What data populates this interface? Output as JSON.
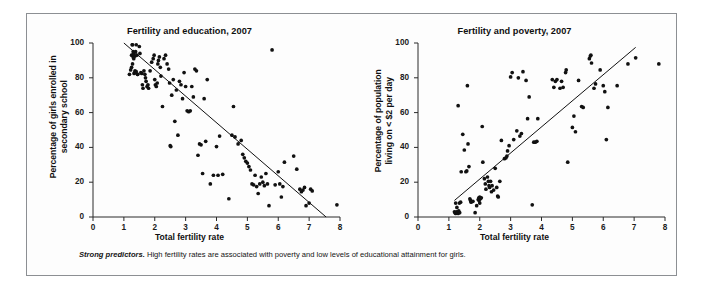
{
  "figure": {
    "caption_lead": "Strong predictors.",
    "caption_body": " High fertility rates are associated with poverty and low levels of educational attainment for girls."
  },
  "chart_data": [
    {
      "type": "scatter",
      "id": "fertility-education",
      "title": "Fertility and education, 2007",
      "xlabel": "Total fertility rate",
      "ylabel": "Percentage of girls enrolled in secondary school",
      "ylabel_lines": [
        "Percentage of girls enrolled in",
        "secondary school"
      ],
      "xlim": [
        0,
        8
      ],
      "ylim": [
        0,
        100
      ],
      "xticks": [
        0,
        1,
        2,
        3,
        4,
        5,
        6,
        7,
        8
      ],
      "yticks": [
        0,
        20,
        40,
        60,
        80,
        100
      ],
      "grid": false,
      "legend": "none",
      "marker_color": "#111111",
      "trendline": {
        "x0": 1.0,
        "y0": 100.0,
        "x1": 7.55,
        "y1": 0.0,
        "color": "#111111"
      },
      "x": [
        1.18,
        1.22,
        1.25,
        1.27,
        1.28,
        1.3,
        1.3,
        1.31,
        1.32,
        1.33,
        1.35,
        1.36,
        1.38,
        1.4,
        1.42,
        1.45,
        1.25,
        1.28,
        1.32,
        1.36,
        1.4,
        1.44,
        1.5,
        1.52,
        1.55,
        1.58,
        1.6,
        1.62,
        1.65,
        1.68,
        1.7,
        1.72,
        1.75,
        1.78,
        1.8,
        1.85,
        1.9,
        1.95,
        1.98,
        2.0,
        2.02,
        2.05,
        2.08,
        2.1,
        2.12,
        2.15,
        2.18,
        2.2,
        2.25,
        2.3,
        2.35,
        2.4,
        2.45,
        2.48,
        2.5,
        2.52,
        2.55,
        2.6,
        2.65,
        2.7,
        2.75,
        2.8,
        2.85,
        2.9,
        2.95,
        3.0,
        3.05,
        3.1,
        3.15,
        3.2,
        3.25,
        3.3,
        3.35,
        3.4,
        3.45,
        3.5,
        3.55,
        3.6,
        3.65,
        3.7,
        3.8,
        3.9,
        4.0,
        4.05,
        4.1,
        4.2,
        4.4,
        4.5,
        4.55,
        4.6,
        4.7,
        4.8,
        4.85,
        4.9,
        4.95,
        5.0,
        5.05,
        5.1,
        5.15,
        5.2,
        5.25,
        5.3,
        5.35,
        5.4,
        5.45,
        5.5,
        5.55,
        5.6,
        5.65,
        5.7,
        5.8,
        5.9,
        6.0,
        6.05,
        6.1,
        6.15,
        6.2,
        6.5,
        6.6,
        6.7,
        6.75,
        6.8,
        6.85,
        6.9,
        7.0,
        7.05,
        7.1,
        7.9
      ],
      "y": [
        82.0,
        84.5,
        93.0,
        99.0,
        99.0,
        92.0,
        95.0,
        93.5,
        94.0,
        82.5,
        83.0,
        92.5,
        95.0,
        99.0,
        93.0,
        82.0,
        86.0,
        88.0,
        91.0,
        84.0,
        83.5,
        82.0,
        98.0,
        94.0,
        83.0,
        82.5,
        76.0,
        74.0,
        84.0,
        82.0,
        80.0,
        78.0,
        75.0,
        76.0,
        74.0,
        84.0,
        89.0,
        91.0,
        93.0,
        79.0,
        76.0,
        75.0,
        77.0,
        88.0,
        90.0,
        92.0,
        86.0,
        81.0,
        63.5,
        91.0,
        93.0,
        88.0,
        85.0,
        77.0,
        41.0,
        40.5,
        70.0,
        79.0,
        55.0,
        73.0,
        47.0,
        78.0,
        76.0,
        68.0,
        83.0,
        75.0,
        61.0,
        60.5,
        61.0,
        75.0,
        69.0,
        85.0,
        84.0,
        35.5,
        42.0,
        41.5,
        25.0,
        68.0,
        43.5,
        79.0,
        19.0,
        24.0,
        40.5,
        24.0,
        46.5,
        24.5,
        10.5,
        47.0,
        63.5,
        46.0,
        42.0,
        44.0,
        36.0,
        34.0,
        32.0,
        31.0,
        29.0,
        27.0,
        19.0,
        18.5,
        24.0,
        17.5,
        13.5,
        19.0,
        23.0,
        20.0,
        18.0,
        25.0,
        19.0,
        6.5,
        96.0,
        18.5,
        26.0,
        19.0,
        11.5,
        17.5,
        31.5,
        35.0,
        27.5,
        16.0,
        14.5,
        15.5,
        17.0,
        6.5,
        8.0,
        16.0,
        15.0,
        7.0
      ]
    },
    {
      "type": "scatter",
      "id": "fertility-poverty",
      "title": "Fertility and poverty, 2007",
      "xlabel": "Total fertility rate",
      "ylabel": "Percentage of population living on < $2 per day",
      "ylabel_lines": [
        "Percentage of population",
        "living on < $2 per day"
      ],
      "xlim": [
        0,
        8
      ],
      "ylim": [
        0,
        100
      ],
      "xticks": [
        0,
        1,
        2,
        3,
        4,
        5,
        6,
        7,
        8
      ],
      "yticks": [
        0,
        20,
        40,
        60,
        80,
        100
      ],
      "grid": false,
      "legend": "none",
      "marker_color": "#111111",
      "trendline": {
        "x0": 1.18,
        "y0": 9.5,
        "x1": 7.05,
        "y1": 97.5,
        "color": "#111111"
      },
      "x": [
        1.18,
        1.2,
        1.22,
        1.25,
        1.27,
        1.3,
        1.32,
        1.35,
        1.22,
        1.26,
        1.3,
        1.34,
        1.38,
        1.4,
        1.45,
        1.5,
        1.55,
        1.58,
        1.6,
        1.62,
        1.65,
        1.68,
        1.7,
        1.72,
        1.78,
        1.85,
        1.9,
        1.95,
        1.97,
        1.98,
        2.0,
        2.0,
        2.02,
        2.05,
        2.08,
        2.1,
        2.15,
        2.18,
        2.2,
        2.25,
        2.28,
        2.3,
        2.32,
        2.35,
        2.38,
        2.4,
        2.45,
        2.5,
        2.55,
        2.58,
        2.6,
        2.65,
        2.7,
        2.8,
        2.85,
        2.88,
        2.9,
        2.95,
        3.0,
        3.05,
        3.1,
        3.2,
        3.25,
        3.3,
        3.35,
        3.4,
        3.5,
        3.55,
        3.6,
        3.7,
        3.75,
        3.8,
        3.85,
        3.88,
        4.35,
        4.4,
        4.45,
        4.5,
        4.6,
        4.65,
        4.7,
        4.78,
        4.8,
        4.85,
        5.0,
        5.05,
        5.1,
        5.2,
        5.3,
        5.35,
        5.55,
        5.58,
        5.6,
        5.62,
        5.7,
        5.75,
        5.9,
        6.0,
        6.05,
        6.1,
        6.15,
        6.45,
        6.8,
        7.05,
        7.8
      ],
      "y": [
        3.0,
        2.5,
        2.0,
        3.0,
        2.5,
        2.0,
        3.5,
        2.5,
        8.0,
        5.5,
        64.0,
        8.0,
        8.5,
        26.0,
        47.5,
        38.5,
        26.0,
        26.5,
        75.5,
        42.0,
        29.0,
        10.5,
        9.5,
        8.5,
        9.0,
        2.5,
        6.5,
        10.0,
        11.0,
        9.5,
        8.0,
        11.5,
        10.5,
        11.0,
        52.0,
        31.5,
        22.0,
        19.0,
        16.0,
        23.0,
        20.5,
        18.0,
        17.0,
        20.5,
        14.5,
        18.0,
        15.5,
        28.0,
        17.0,
        12.0,
        11.5,
        20.5,
        44.0,
        33.5,
        34.0,
        35.0,
        38.0,
        41.0,
        80.5,
        83.0,
        44.5,
        49.5,
        80.0,
        46.5,
        48.0,
        83.5,
        78.5,
        56.5,
        69.0,
        7.0,
        43.0,
        43.0,
        43.5,
        56.5,
        79.0,
        74.5,
        78.0,
        79.0,
        74.0,
        78.0,
        74.5,
        83.0,
        84.5,
        31.5,
        51.5,
        58.0,
        49.0,
        78.5,
        63.5,
        63.0,
        91.0,
        92.5,
        93.0,
        88.5,
        74.0,
        76.5,
        84.5,
        75.5,
        72.0,
        44.5,
        63.0,
        75.5,
        88.0,
        91.5,
        88.0
      ]
    }
  ]
}
